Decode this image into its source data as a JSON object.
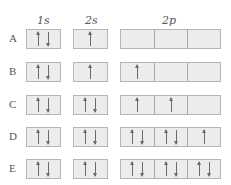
{
  "headers": {
    "s1": "1s",
    "s2": "2s",
    "p2": "2p"
  },
  "rows": [
    {
      "label": "A",
      "s1": "updown",
      "s2": "up",
      "p2": [
        "",
        "",
        ""
      ]
    },
    {
      "label": "B",
      "s1": "updown",
      "s2": "up",
      "p2": [
        "up",
        "",
        ""
      ]
    },
    {
      "label": "C",
      "s1": "updown",
      "s2": "updown",
      "p2": [
        "up",
        "up",
        ""
      ]
    },
    {
      "label": "D",
      "s1": "updown",
      "s2": "updown",
      "p2": [
        "updown",
        "updown",
        "up"
      ]
    },
    {
      "label": "E",
      "s1": "updown",
      "s2": "updown",
      "p2": [
        "updown",
        "updown",
        "updown"
      ]
    }
  ],
  "colors": {
    "box_fill": "#ececec",
    "box_border": "#b5b5b5",
    "arrow": "#6a6a6a"
  }
}
